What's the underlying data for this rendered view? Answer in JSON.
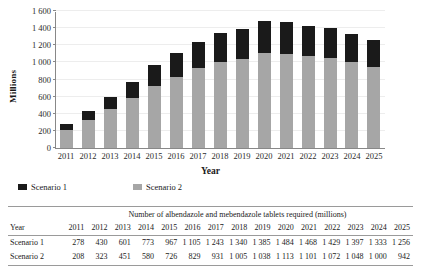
{
  "chart_data": {
    "type": "bar",
    "stacked": true,
    "title": "",
    "xlabel": "Year",
    "ylabel": "Millions",
    "categories": [
      "2011",
      "2012",
      "2013",
      "2014",
      "2015",
      "2016",
      "2017",
      "2018",
      "2019",
      "2020",
      "2021",
      "2022",
      "2023",
      "2024",
      "2025"
    ],
    "series": [
      {
        "name": "Scenario 1",
        "color": "#1a1a1a",
        "values": [
          278,
          430,
          601,
          773,
          967,
          1105,
          1243,
          1340,
          1385,
          1484,
          1468,
          1429,
          1397,
          1333,
          1256
        ]
      },
      {
        "name": "Scenario 2",
        "color": "#a6a6a6",
        "values": [
          208,
          323,
          451,
          580,
          726,
          829,
          931,
          1005,
          1038,
          1113,
          1101,
          1072,
          1048,
          1000,
          942
        ]
      }
    ],
    "ylim": [
      0,
      1600
    ],
    "yticks": [
      0,
      200,
      400,
      600,
      800,
      1000,
      1200,
      1400,
      1600
    ],
    "ytick_labels": [
      "0",
      "200",
      "400",
      "600",
      "800",
      "1 000",
      "1 200",
      "1 400",
      "1 600"
    ],
    "grid": true,
    "legend_position": "below-left"
  },
  "legend": {
    "items": [
      {
        "label": "Scenario 1",
        "color": "#1a1a1a"
      },
      {
        "label": "Scenario 2",
        "color": "#a6a6a6"
      }
    ]
  },
  "table": {
    "caption": "Number of albendazole and mebendazole tablets required (millions)",
    "row_header_label": "Year",
    "columns": [
      "2011",
      "2012",
      "2013",
      "2014",
      "2015",
      "2016",
      "2017",
      "2018",
      "2019",
      "2020",
      "2021",
      "2022",
      "2023",
      "2024",
      "2025"
    ],
    "rows": [
      {
        "label": "Scenario 1",
        "values": [
          "278",
          "430",
          "601",
          "773",
          "967",
          "1 105",
          "1 243",
          "1 340",
          "1 385",
          "1 484",
          "1 468",
          "1 429",
          "1 397",
          "1 333",
          "1 256"
        ]
      },
      {
        "label": "Scenario 2",
        "values": [
          "208",
          "323",
          "451",
          "580",
          "726",
          "829",
          "931",
          "1 005",
          "1 038",
          "1 113",
          "1 101",
          "1 072",
          "1 048",
          "1 000",
          "942"
        ]
      }
    ]
  }
}
